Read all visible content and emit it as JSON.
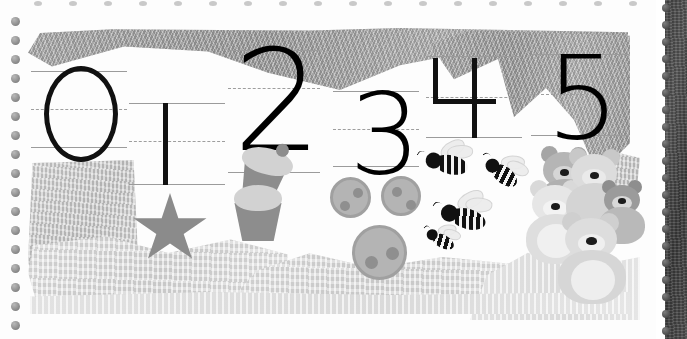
{
  "page": {
    "media": "spiral-bound scrapbook page, grayscale torn-paper collage",
    "width": 687,
    "height": 339,
    "background_color": "#fdfdfd"
  },
  "binding": {
    "left_holes_label": "spiral-hole",
    "top_holes_label": "spiral-hole-top",
    "left_hole_count": 17,
    "top_hole_count": 18,
    "spine_bead_count": 20,
    "spine_color": "#4a4a4a",
    "hole_color": "#8e8e8e"
  },
  "collage": {
    "dark_band_color": "#a8a8a8",
    "mid_band_color": "#c6c6c6",
    "light_band_color": "#dadada",
    "pale_band_color": "#e6e6e6"
  },
  "ruled_lines": {
    "top_line_color": "#9b9b9b",
    "mid_line_color": "#9e9e9e",
    "bottom_line_color": "#9b9b9b",
    "mid_line_style": "dashed"
  },
  "numerals": [
    {
      "value": "0",
      "name": "numeral-zero",
      "shape": "outlined-ellipse",
      "color": "#111111"
    },
    {
      "value": "1",
      "name": "numeral-one",
      "shape": "vertical-stroke",
      "color": "#111111"
    },
    {
      "value": "2",
      "name": "numeral-two",
      "shape": "glyph",
      "color": "#000000"
    },
    {
      "value": "3",
      "name": "numeral-three",
      "shape": "glyph",
      "color": "#000000"
    },
    {
      "value": "4",
      "name": "numeral-four",
      "shape": "stroke-built",
      "color": "#111111"
    },
    {
      "value": "5",
      "name": "numeral-five",
      "shape": "glyph",
      "color": "#000000"
    }
  ],
  "counting_sets": [
    {
      "numeral": "0",
      "object": "none",
      "count": 0,
      "object_label": "nothing"
    },
    {
      "numeral": "1",
      "object": "star",
      "count": 1,
      "object_label": "star",
      "color": "#8b8b8b"
    },
    {
      "numeral": "2",
      "object": "cupcake",
      "count": 2,
      "object_label": "cupcakes",
      "color": "#8d8d8d",
      "frosting_color": "#d2d2d2"
    },
    {
      "numeral": "3",
      "object": "cookie",
      "count": 3,
      "object_label": "cookies",
      "color": "#b4b4b4",
      "chip_color": "#8f8f8f"
    },
    {
      "numeral": "4",
      "object": "bee",
      "count": 4,
      "object_label": "bees",
      "color": "#111111",
      "wing_color": "#ebebeb"
    },
    {
      "numeral": "5",
      "object": "teddy-bear",
      "count": 5,
      "object_label": "teddy bears",
      "color": "#c9c9c9"
    }
  ]
}
